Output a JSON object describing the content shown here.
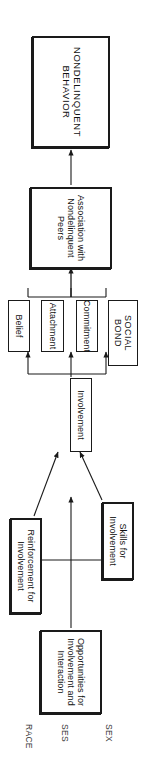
{
  "figure": {
    "orientation": "rotated-90-clockwise",
    "page_size": {
      "width": 142,
      "height": 780
    },
    "line_color": "#1a1a1a",
    "text_color": "#111111",
    "background": "#ffffff"
  },
  "nodes": {
    "nondelinquent_behavior": {
      "label": "NONDELINQUENT BEHAVIOR",
      "style": "heavy"
    },
    "association_peers": {
      "label": "Association with Nondelinquent Peers",
      "style": "heavy"
    },
    "social_bond": {
      "label": "SOCIAL BOND",
      "style": "plain"
    },
    "commitment": {
      "label": "Commitment",
      "style": "plain"
    },
    "attachment": {
      "label": "Attachment",
      "style": "plain"
    },
    "belief": {
      "label": "Belief",
      "style": "plain"
    },
    "involvement": {
      "label": "Involvement",
      "style": "plain"
    },
    "skills": {
      "label": "Skills for Involvement",
      "style": "heavy"
    },
    "reinforcement": {
      "label": "Reinforcement for Involvement",
      "style": "heavy"
    },
    "opportunities": {
      "label": "Opportunities for Involvement and Interaction",
      "style": "heavy"
    }
  },
  "background_variables": [
    {
      "label": "SEX"
    },
    {
      "label": "SES"
    },
    {
      "label": "RACE"
    }
  ],
  "edges": [
    {
      "from": "association_peers",
      "to": "nondelinquent_behavior",
      "type": "arrow"
    },
    {
      "from": "commitment",
      "to": "association_peers",
      "type": "bracket-arrow"
    },
    {
      "from": "attachment",
      "to": "association_peers",
      "type": "bracket-arrow"
    },
    {
      "from": "belief",
      "to": "association_peers",
      "type": "bracket-arrow"
    },
    {
      "from": "involvement",
      "to": "commitment",
      "type": "bracket-arrow"
    },
    {
      "from": "involvement",
      "to": "attachment",
      "type": "bracket-arrow"
    },
    {
      "from": "involvement",
      "to": "belief",
      "type": "bracket-arrow"
    },
    {
      "from": "skills",
      "to": "involvement",
      "type": "arrow"
    },
    {
      "from": "reinforcement",
      "to": "involvement",
      "type": "arrow"
    },
    {
      "from": "opportunities",
      "to": "involvement",
      "type": "arrow"
    },
    {
      "from": "skills",
      "to": "reinforcement",
      "type": "double-arrow"
    }
  ]
}
